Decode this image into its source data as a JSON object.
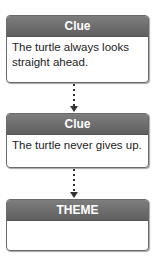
{
  "diagram": {
    "boxes": [
      {
        "title": "Clue",
        "text": "The turtle always looks straight ahead."
      },
      {
        "title": "Clue",
        "text": "The turtle never gives up."
      },
      {
        "title": "THEME",
        "text": ""
      }
    ],
    "colors": {
      "header": "#6e6e6e",
      "border": "#6a6a6a",
      "connector": "#333333"
    }
  }
}
